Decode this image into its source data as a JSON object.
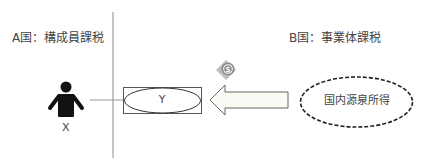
{
  "diagram": {
    "country_a": {
      "label": "A国：構成員課税"
    },
    "country_b": {
      "label": "B国：事業体課税"
    },
    "member": {
      "label": "X",
      "icon": "person-icon"
    },
    "entity": {
      "label": "Y"
    },
    "income": {
      "label": "国内源泉所得",
      "border_style": "dashed"
    },
    "flow_arrow": {
      "direction": "left",
      "fill": "#fafaf5"
    },
    "money_icon": {
      "icon": "money-tag-icon",
      "color": "#8a8a8a"
    },
    "colors": {
      "divider": "#b0b0b0",
      "connector": "#999999",
      "outline": "#555555",
      "person": "#111111"
    }
  }
}
